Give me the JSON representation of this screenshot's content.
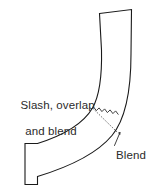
{
  "figure": {
    "background_color": "#ffffff",
    "line_color": "#1a1a1a",
    "text_color": "#2b2b2b",
    "width": 162,
    "height": 192
  },
  "annotations": {
    "slash_label": {
      "line_1": "Slash, overlap",
      "line_2": "and blend"
    },
    "blend_label": {
      "text": "Blend"
    }
  },
  "geometry": {
    "shape_name": "elbow-band-outline",
    "outline_path": "M 99.5 13.5 L 131.5 9.5 L 131.0 54.0 C 131.0 88.0 126.5 118.0 112.0 135.5 C 97.0 153.5 72.0 166.0 37.5 176.5 L 37.5 184.5 L 25.0 184.5 L 25.0 143.5 L 37.5 143.5 C 66.0 134.5 83.5 123.5 92.5 108.0 C 100.5 94.0 102.0 73.0 101.5 50.0 Z",
    "seam_guide_path": "M 92.5 108.0 L 117.0 132.0",
    "zigzag_path": "M 93.5 107.0 L 96.4 110.6 L 99.1 107.9 L 101.9 111.6 L 104.6 108.9 L 107.4 112.6 L 110.1 109.9 L 112.9 113.6 L 115.6 110.9 L 118.4 114.6",
    "leader_path": "M 114.5 145.5 L 120.0 132.5 M 118.5 133.0 L 120.0 132.5 L 119.8 134.6",
    "seam_description": "zigzag sawtooth seam across the elbow joint"
  }
}
